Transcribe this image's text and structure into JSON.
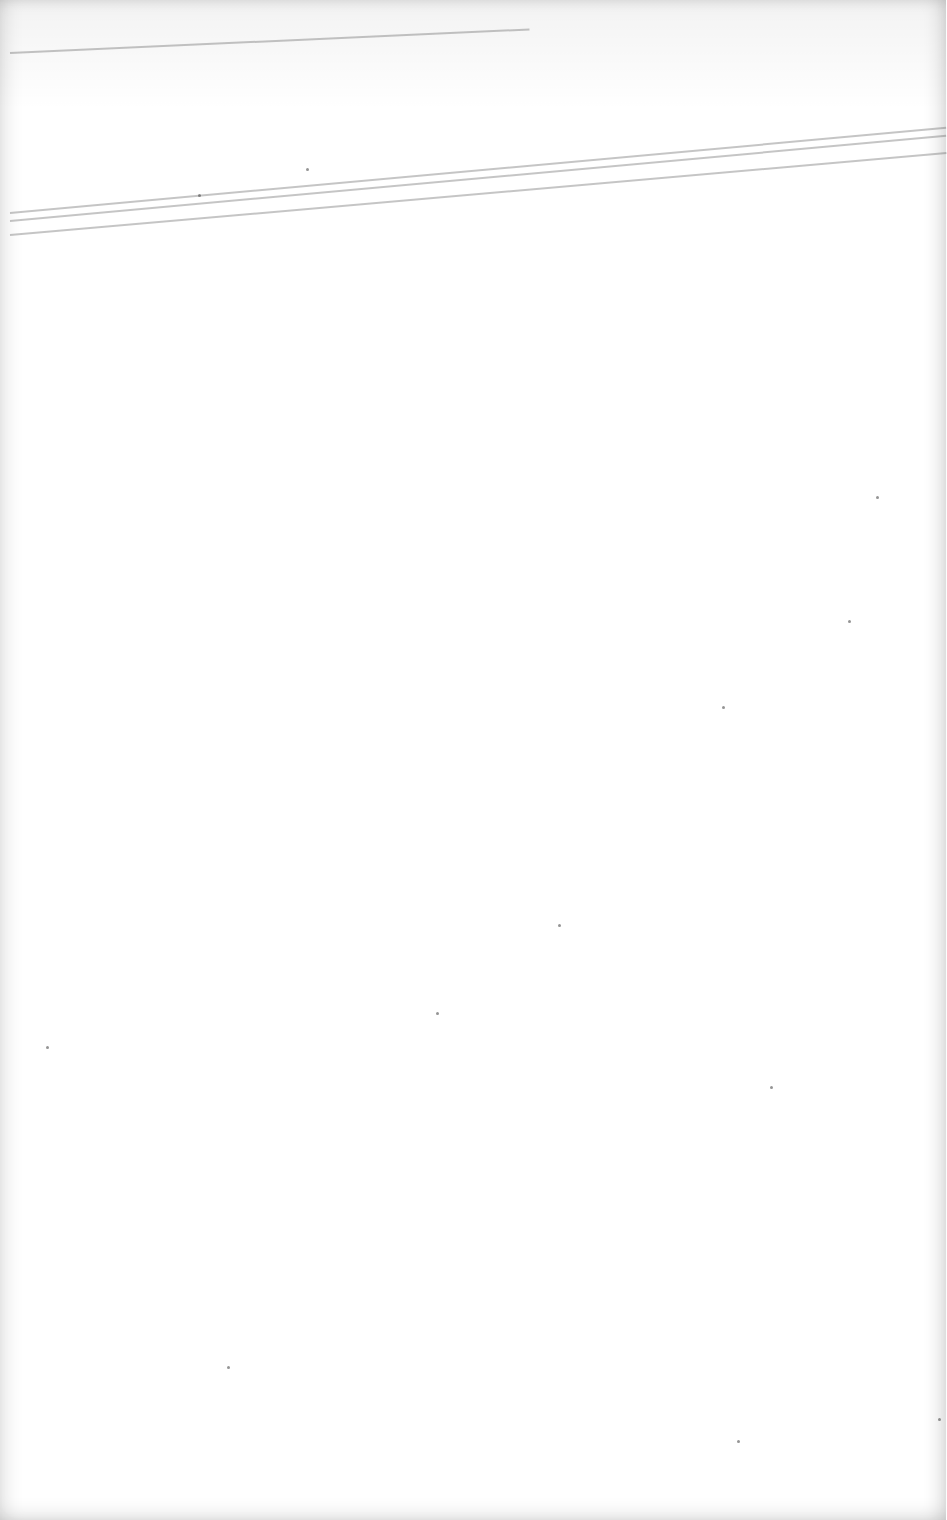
{
  "document": {
    "type": "blank scanned page",
    "text": "",
    "background_color": "#ffffff",
    "streak_color": "#8a8a8a"
  },
  "streaks": [
    {
      "x": 10,
      "y": 52,
      "length": 520,
      "angle": -2.6
    },
    {
      "x": 10,
      "y": 212,
      "length": 940,
      "angle": -5.2
    },
    {
      "x": 10,
      "y": 220,
      "length": 940,
      "angle": -5.2
    },
    {
      "x": 10,
      "y": 234,
      "length": 940,
      "angle": -5.0
    }
  ],
  "specks": [
    {
      "x": 306,
      "y": 168
    },
    {
      "x": 198,
      "y": 194
    },
    {
      "x": 876,
      "y": 496
    },
    {
      "x": 848,
      "y": 620
    },
    {
      "x": 722,
      "y": 706
    },
    {
      "x": 558,
      "y": 924
    },
    {
      "x": 436,
      "y": 1012
    },
    {
      "x": 770,
      "y": 1086
    },
    {
      "x": 46,
      "y": 1046
    },
    {
      "x": 227,
      "y": 1366
    },
    {
      "x": 737,
      "y": 1440
    },
    {
      "x": 938,
      "y": 1418
    }
  ]
}
